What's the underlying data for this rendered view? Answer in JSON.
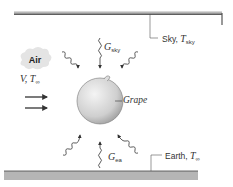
{
  "diagram": {
    "air": {
      "label": "Air",
      "flow_symbol": "V",
      "temp_symbol": "T",
      "temp_subscript": "∞"
    },
    "grape": {
      "label": "Grape"
    },
    "sky": {
      "label": "Sky, ",
      "temp_symbol": "T",
      "temp_subscript": "sky"
    },
    "earth": {
      "label": "Earth, ",
      "temp_symbol": "T",
      "temp_subscript": "∞"
    },
    "irradiation_sky": {
      "symbol": "G",
      "subscript": "sky"
    },
    "irradiation_earth": {
      "symbol": "G",
      "subscript": "ea"
    },
    "colors": {
      "surface": "#b5b5b5",
      "line": "#333333",
      "grape_light": "#f2f2f2",
      "grape_dark": "#a8a8a8",
      "cloud": "#e4e4e4"
    }
  }
}
